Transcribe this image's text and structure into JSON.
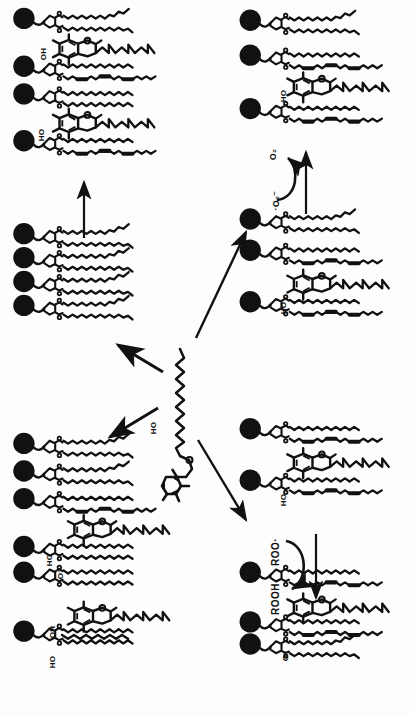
{
  "figure": {
    "background_color": "#ffffff",
    "ink_color": "#111111",
    "width": 414,
    "height": 715
  },
  "panels": [
    {
      "id": "top-left",
      "name": "membrane-panel-top-left",
      "description": "Phospholipid bilayer leaflet with intercalated alpha-tocopherol molecules",
      "headgroup_count": 4,
      "tocopherol_count": 2,
      "labels": [
        "OH",
        "HO"
      ]
    },
    {
      "id": "middle-left",
      "name": "membrane-panel-middle-left",
      "description": "Phospholipid leaflet without tocopherol",
      "headgroup_count": 4,
      "tocopherol_count": 0,
      "labels": []
    },
    {
      "id": "bottom-left",
      "name": "membrane-panel-bottom-left",
      "description": "Phospholipid leaflet with tocopheroxide / tocopherol species",
      "headgroup_count": 6,
      "tocopherol_count": 2,
      "labels": [
        "HO",
        "O-",
        "OH",
        "HO"
      ]
    },
    {
      "id": "top-right",
      "name": "membrane-panel-top-right",
      "description": "Phospholipid leaflet with tocopherol, product of superoxide step",
      "headgroup_count": 3,
      "tocopherol_count": 1,
      "labels": [
        "HO"
      ]
    },
    {
      "id": "middle-right",
      "name": "membrane-panel-middle-right",
      "description": "Phospholipid leaflet with tocopherol entering oxidation cycle",
      "headgroup_count": 3,
      "tocopherol_count": 1,
      "labels": [
        "HO"
      ]
    },
    {
      "id": "bottom-right-upper",
      "name": "membrane-panel-bottom-right-upper",
      "description": "Phospholipid leaflet with tocopherol before peroxyl radical reaction",
      "headgroup_count": 2,
      "tocopherol_count": 1,
      "labels": [
        "HO"
      ]
    },
    {
      "id": "bottom-right-lower",
      "name": "membrane-panel-bottom-right-lower",
      "description": "Phospholipid leaflet with tocopheroxyl anion after ROOH formation",
      "headgroup_count": 3,
      "tocopherol_count": 1,
      "labels": [
        "O-"
      ]
    }
  ],
  "center_molecule": {
    "name": "alpha-tocopherol",
    "label": "HO",
    "description": "Free alpha-tocopherol with chromanol head and phytyl tail, vertical orientation"
  },
  "reactions": {
    "superoxide": {
      "reactant_label": "·O₂⁻",
      "product_label": "O₂",
      "reactant_plain": "O2 radical anion",
      "product_plain": "O2"
    },
    "peroxyl": {
      "reactant_label": "ROO·",
      "product_label": "ROOH",
      "reactant_plain": "ROO radical",
      "product_plain": "ROOH"
    }
  },
  "arrows": [
    {
      "name": "arrow-up-left-panel",
      "direction": "up",
      "from": "middle-left",
      "to": "top-left"
    },
    {
      "name": "arrow-up-right-diagonal",
      "direction": "up-right",
      "from": "center",
      "to": "middle-right"
    },
    {
      "name": "arrow-in-to-center-upleft",
      "direction": "up-left",
      "from": "center",
      "to": "middle-left"
    },
    {
      "name": "arrow-down-left-diagonal",
      "direction": "down-left",
      "from": "center",
      "to": "bottom-left"
    },
    {
      "name": "arrow-down-right-diagonal",
      "direction": "down-right",
      "from": "center",
      "to": "bottom-right-upper"
    },
    {
      "name": "arrow-superoxide-vertical",
      "direction": "up",
      "from": "middle-right",
      "to": "top-right"
    },
    {
      "name": "arrow-peroxyl-vertical",
      "direction": "down",
      "from": "bottom-right-upper",
      "to": "bottom-right-lower"
    },
    {
      "name": "arrow-superoxide-curved",
      "direction": "curved-ccw",
      "from": "superoxide-reactant",
      "to": "superoxide-product"
    },
    {
      "name": "arrow-peroxyl-curved",
      "direction": "curved-cw",
      "from": "peroxyl-reactant",
      "to": "peroxyl-product"
    }
  ],
  "labels": {
    "o2": "O₂",
    "superoxide": "·O₂⁻",
    "roo_radical": "ROO·",
    "rooh": "ROOH",
    "ho": "HO",
    "oh": "OH",
    "o_minus": "O⁻"
  }
}
